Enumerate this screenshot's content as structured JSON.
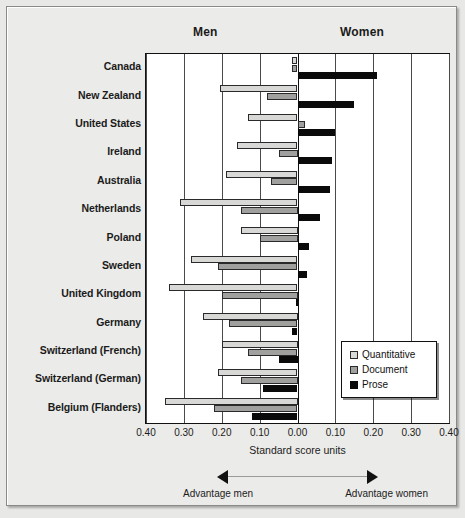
{
  "header": {
    "men_label": "Men",
    "women_label": "Women"
  },
  "axis": {
    "title": "Standard score units",
    "ticks": [
      "0.40",
      "0.30",
      "0.20",
      "0.10",
      "0.00",
      "0.10",
      "0.20",
      "0.30",
      "0.40"
    ],
    "advantage_men": "Advantage men",
    "advantage_women": "Advantage women"
  },
  "legend": {
    "items": [
      {
        "label": "Quantitative",
        "color": "#d8d8d6"
      },
      {
        "label": "Document",
        "color": "#a0a09e"
      },
      {
        "label": "Prose",
        "color": "#0a0a0a"
      }
    ]
  },
  "chart_data": {
    "type": "bar",
    "orientation": "horizontal",
    "title": "",
    "subtitle": "",
    "xlabel": "Standard score units",
    "ylabel": "",
    "xlim": [
      -0.4,
      0.4
    ],
    "xticks": [
      -0.4,
      -0.3,
      -0.2,
      -0.1,
      0.0,
      0.1,
      0.2,
      0.3,
      0.4
    ],
    "xticklabels": [
      "0.40",
      "0.30",
      "0.20",
      "0.10",
      "0.00",
      "0.10",
      "0.20",
      "0.30",
      "0.40"
    ],
    "grid": true,
    "legend_position": "right-lower",
    "note": "Negative values = advantage men (left of zero); positive values = advantage women (right of zero).",
    "categories": [
      "Canada",
      "New Zealand",
      "United States",
      "Ireland",
      "Australia",
      "Netherlands",
      "Poland",
      "Sweden",
      "United Kingdom",
      "Germany",
      "Switzerland (French)",
      "Switzerland (German)",
      "Belgium (Flanders)"
    ],
    "series": [
      {
        "name": "Quantitative",
        "color": "#d8d8d6",
        "values": [
          -0.015,
          -0.205,
          -0.13,
          -0.16,
          -0.19,
          -0.31,
          -0.15,
          -0.28,
          -0.34,
          -0.25,
          -0.2,
          -0.21,
          -0.35
        ]
      },
      {
        "name": "Document",
        "color": "#a0a09e",
        "values": [
          -0.015,
          -0.08,
          0.02,
          -0.05,
          -0.07,
          -0.15,
          -0.1,
          -0.21,
          -0.2,
          -0.18,
          -0.13,
          -0.15,
          -0.22
        ]
      },
      {
        "name": "Prose",
        "color": "#0a0a0a",
        "values": [
          0.21,
          0.15,
          0.1,
          0.09,
          0.085,
          0.06,
          0.03,
          0.025,
          -0.005,
          -0.015,
          -0.05,
          -0.09,
          -0.12
        ]
      }
    ]
  }
}
